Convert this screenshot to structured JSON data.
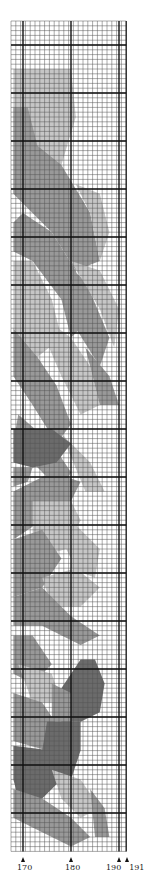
{
  "chart_data": {
    "type": "cross-stitch-pattern",
    "title": "",
    "grid": {
      "left": 11,
      "top": 21,
      "cell": 4.8,
      "cols": 24,
      "rows": 173,
      "first_col_index": 168,
      "major_every": 10,
      "minor_color": "#555555",
      "major_color": "#111111"
    },
    "palette": {
      "dark": "#6b6b6b",
      "medium": "#999999",
      "light": "#c6c6c6",
      "background": "#ffffff"
    },
    "x_axis": {
      "ticks": [
        {
          "label": "170",
          "col": 170
        },
        {
          "label": "180",
          "col": 180
        },
        {
          "label": "190",
          "col": 190
        },
        {
          "label": "191",
          "col": 191
        }
      ]
    },
    "regions": [
      {
        "shade": "medium",
        "points": "[[170,12],[175,12],[175,22],[172,26],[170,26]]"
      },
      {
        "shade": "light",
        "points": "[[168,10],[180,10],[181,20],[178,30],[174,36],[168,36]]"
      },
      {
        "shade": "medium",
        "points": "[[168,18],[171,18],[173,26],[178,30],[184,40],[186,50],[181,52],[176,44],[170,38],[168,36]]"
      },
      {
        "shade": "light",
        "points": "[[181,34],[186,36],[188,44],[186,50],[184,40]]"
      },
      {
        "shade": "medium",
        "points": "[[170,40],[176,44],[181,52],[184,62],[180,66],[178,58],[172,50],[168,48],[168,42]]"
      },
      {
        "shade": "light",
        "points": "[[168,50],[172,50],[176,58],[178,66],[173,70],[168,64]]"
      },
      {
        "shade": "medium",
        "points": "[[175,48],[183,54],[188,66],[186,72],[181,64]]"
      },
      {
        "shade": "light",
        "points": "[[180,50],[186,52],[190,60],[189,68],[186,60]]"
      },
      {
        "shade": "medium",
        "points": "[[168,64],[173,70],[177,76],[180,84],[177,88],[172,80],[168,74]]"
      },
      {
        "shade": "light",
        "points": "[[172,60],[180,66],[184,72],[186,80],[182,82],[178,74]]"
      },
      {
        "shade": "medium",
        "points": "[[183,68],[188,74],[190,80],[186,80]]"
      },
      {
        "shade": "medium",
        "points": "[[169,82],[176,88],[180,94],[178,98],[172,92],[168,88]]"
      },
      {
        "shade": "light",
        "points": "[[178,86],[184,92],[187,98],[183,98]]"
      },
      {
        "shade": "dark",
        "points": "[[168,85],[176,85],[180,88],[177,92],[172,93],[168,92]]"
      },
      {
        "shade": "medium",
        "points": "[[168,93],[172,93],[171,96],[168,97]]"
      },
      {
        "shade": "medium",
        "points": "[[168,98],[176,94],[182,96],[180,100],[174,104],[168,108]]"
      },
      {
        "shade": "light",
        "points": "[[172,100],[180,100],[182,104],[179,110],[172,112]]"
      },
      {
        "shade": "light",
        "points": "[[180,104],[186,110],[185,116],[180,114]]"
      },
      {
        "shade": "medium",
        "points": "[[168,108],[174,106],[178,112],[174,118],[168,120]]"
      },
      {
        "shade": "light",
        "points": "[[174,116],[181,114],[186,118],[182,122],[176,122]]"
      },
      {
        "shade": "medium",
        "points": "[[168,120],[174,118],[180,124],[186,128],[182,130],[174,126],[168,126]]"
      },
      {
        "shade": "light",
        "points": "[[176,104],[182,106],[184,112],[180,112]]"
      },
      {
        "shade": "medium",
        "points": "[[168,128],[172,128],[176,134],[172,138],[168,136]]"
      },
      {
        "shade": "light",
        "points": "[[169,134],[176,136],[178,142],[172,142]]"
      },
      {
        "shade": "dark",
        "points": "[[182,133],[185,133],[187,138],[186,144],[182,146],[178,146],[178,139]]"
      },
      {
        "shade": "medium",
        "points": "[[176,138],[180,140],[180,146],[176,146]]"
      },
      {
        "shade": "medium",
        "points": "[[168,140],[174,142],[178,148],[175,152],[168,150]]"
      },
      {
        "shade": "dark",
        "points": "[[175,146],[182,146],[182,152],[180,158],[176,158],[174,152]]"
      },
      {
        "shade": "dark",
        "points": "[[168,151],[176,152],[178,158],[174,162],[169,162],[168,158]]"
      },
      {
        "shade": "medium",
        "points": "[[168,160],[174,162],[180,166],[184,170],[180,172],[172,168],[168,166]]"
      },
      {
        "shade": "light",
        "points": "[[176,156],[182,158],[186,164],[182,166],[178,162]]"
      },
      {
        "shade": "medium",
        "points": "[[184,160],[187,164],[188,170],[185,170]]"
      }
    ]
  }
}
